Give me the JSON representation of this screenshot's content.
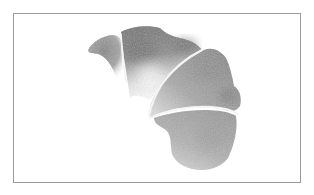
{
  "image": {
    "description": "Grayscale watercolor illustration of a segmented croissant-like shape inside a thin gray frame",
    "subject": "watercolor-croissant-shape",
    "segments": 4,
    "colors": {
      "background": "#ffffff",
      "frame_border": "#9a9a9a",
      "dark_wash": "#6e6e6e",
      "mid_wash": "#8f8f8f",
      "light_wash": "#b8b8b8",
      "highlight_seam": "#f2f2f2"
    }
  }
}
